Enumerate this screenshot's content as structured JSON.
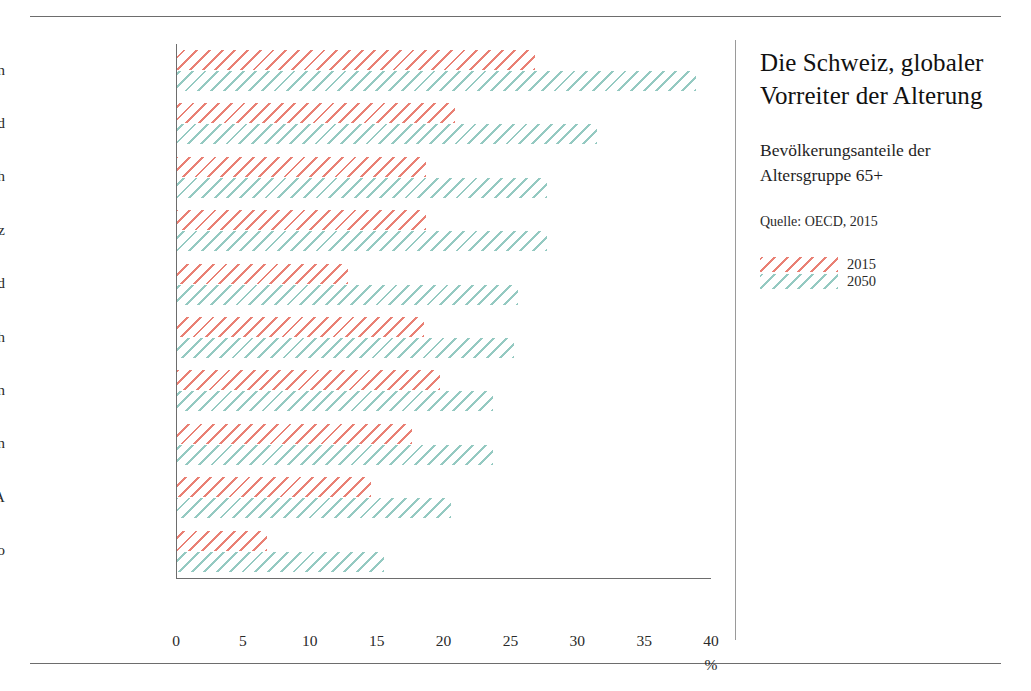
{
  "panel": {
    "title": "Die Schweiz, globaler Vorreiter der Alterung",
    "subtitle": "Bevölkerungsanteile der Altersgruppe 65+",
    "source": "Quelle: OECD, 2015",
    "legend": [
      {
        "label": "2015",
        "color": "#e56a5c"
      },
      {
        "label": "2050",
        "color": "#7abcb2"
      }
    ]
  },
  "chart_data": {
    "type": "bar",
    "orientation": "horizontal",
    "title": "Die Schweiz, globaler Vorreiter der Alterung",
    "subtitle": "Bevölkerungsanteile der Altersgruppe 65+",
    "source": "Quelle: OECD, 2015",
    "xlabel": "%",
    "ylabel": "",
    "xlim": [
      0,
      40
    ],
    "xticks": [
      0,
      5,
      10,
      15,
      20,
      25,
      30,
      35,
      40
    ],
    "grid": false,
    "legend_position": "right",
    "categories": [
      "Japan",
      "Deutschland",
      "Österreich",
      "Schweiz",
      "Irland",
      "Frankreich",
      "Schweden",
      "Grossbritannien",
      "USA",
      "Mexiko"
    ],
    "series": [
      {
        "name": "2015",
        "color": "#e56a5c",
        "values": [
          26.8,
          20.8,
          18.6,
          18.6,
          12.8,
          18.5,
          19.7,
          17.6,
          14.5,
          6.7
        ]
      },
      {
        "name": "2050",
        "color": "#7abcb2",
        "values": [
          38.8,
          31.4,
          27.7,
          27.7,
          25.5,
          25.2,
          23.6,
          23.6,
          20.5,
          15.5
        ]
      }
    ]
  }
}
